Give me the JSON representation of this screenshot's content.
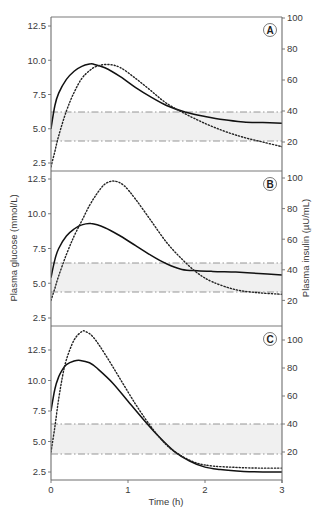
{
  "chart_data": {
    "type": "line",
    "layout": "three vertically stacked panels sharing x axis, dual y axes",
    "xlabel": "Time (h)",
    "ylabel_left": "Plasma glucose (mmol/L)",
    "ylabel_right": "Plasma insulin (µU/mL)",
    "x_ticks": [
      "0",
      "1",
      "2",
      "3"
    ],
    "xlim": [
      0,
      3
    ],
    "y_left_ticks": [
      "2.5",
      "5.0",
      "7.5",
      "10.0",
      "12.5"
    ],
    "y_right_ticks": [
      "20",
      "40",
      "60",
      "80",
      "100"
    ],
    "legend": [
      {
        "name": "Plasma glucose",
        "style": "solid line",
        "axis": "left"
      },
      {
        "name": "Plasma insulin",
        "style": "dotted line",
        "axis": "right"
      }
    ],
    "grid": false,
    "panels": [
      {
        "label": "A",
        "glucose_ylim": [
          2.0,
          13.2
        ],
        "insulin_ylim": [
          0,
          100
        ],
        "normal_band_glucose": [
          4.1,
          6.2
        ],
        "series": [
          {
            "name": "Plasma glucose",
            "axis": "left",
            "style": "solid",
            "x": [
              0,
              0.05,
              0.1,
              0.2,
              0.3,
              0.4,
              0.5,
              0.55,
              0.7,
              0.9,
              1.1,
              1.3,
              1.5,
              1.75,
              2.0,
              2.25,
              2.5,
              2.75,
              3.0
            ],
            "values": [
              5.0,
              6.7,
              7.6,
              8.6,
              9.2,
              9.55,
              9.72,
              9.72,
              9.45,
              8.8,
              8.0,
              7.3,
              6.7,
              6.2,
              5.9,
              5.65,
              5.5,
              5.45,
              5.4
            ]
          },
          {
            "name": "Plasma insulin",
            "axis": "right",
            "style": "dotted",
            "x": [
              0,
              0.05,
              0.1,
              0.2,
              0.3,
              0.4,
              0.5,
              0.6,
              0.75,
              0.9,
              1.1,
              1.3,
              1.5,
              1.75,
              2.0,
              2.25,
              2.5,
              2.75,
              3.0
            ],
            "values": [
              4,
              14,
              24,
              40,
              52,
              61,
              66,
              69,
              70,
              68,
              61,
              53,
              45,
              38,
              32,
              27,
              23,
              20,
              17
            ]
          }
        ]
      },
      {
        "label": "B",
        "glucose_ylim": [
          1.8,
          13.1
        ],
        "insulin_ylim": [
          0,
          100
        ],
        "normal_band_glucose": [
          4.3,
          6.3
        ],
        "series": [
          {
            "name": "Plasma glucose",
            "axis": "left",
            "style": "solid",
            "x": [
              0,
              0.05,
              0.1,
              0.2,
              0.3,
              0.4,
              0.52,
              0.7,
              0.9,
              1.1,
              1.3,
              1.5,
              1.7,
              1.9,
              2.1,
              2.4,
              2.7,
              3.0
            ],
            "values": [
              5.4,
              6.7,
              7.5,
              8.4,
              8.9,
              9.2,
              9.3,
              9.0,
              8.4,
              7.7,
              7.0,
              6.4,
              6.0,
              5.9,
              5.85,
              5.8,
              5.7,
              5.6
            ]
          },
          {
            "name": "Plasma insulin",
            "axis": "right",
            "style": "dotted",
            "x": [
              0,
              0.05,
              0.1,
              0.2,
              0.3,
              0.4,
              0.5,
              0.6,
              0.7,
              0.82,
              0.95,
              1.1,
              1.3,
              1.5,
              1.7,
              1.9,
              2.1,
              2.4,
              2.7,
              3.0
            ],
            "values": [
              20,
              28,
              36,
              50,
              62,
              72,
              82,
              90,
              96,
              98,
              95,
              86,
              72,
              58,
              47,
              38,
              32,
              27,
              25,
              24
            ]
          }
        ]
      },
      {
        "label": "C",
        "glucose_ylim": [
          1.9,
          14.3
        ],
        "insulin_ylim": [
          0,
          100
        ],
        "normal_band_glucose": [
          3.9,
          6.4
        ],
        "series": [
          {
            "name": "Plasma glucose",
            "axis": "left",
            "style": "solid",
            "x": [
              0,
              0.05,
              0.1,
              0.15,
              0.2,
              0.3,
              0.38,
              0.5,
              0.6,
              0.8,
              1.0,
              1.2,
              1.4,
              1.6,
              1.8,
              2.0,
              2.2,
              2.5,
              2.75,
              3.0
            ],
            "values": [
              7.5,
              9.3,
              10.3,
              10.9,
              11.3,
              11.6,
              11.65,
              11.45,
              11.0,
              9.8,
              8.3,
              6.8,
              5.4,
              4.2,
              3.4,
              2.9,
              2.7,
              2.55,
              2.5,
              2.5
            ]
          },
          {
            "name": "Plasma insulin",
            "axis": "right",
            "style": "dotted",
            "x": [
              0,
              0.05,
              0.1,
              0.15,
              0.2,
              0.3,
              0.4,
              0.45,
              0.55,
              0.7,
              0.9,
              1.1,
              1.3,
              1.5,
              1.7,
              1.9,
              2.1,
              2.4,
              2.7,
              3.0
            ],
            "values": [
              20,
              38,
              58,
              74,
              86,
              100,
              106,
              106,
              102,
              90,
              72,
              54,
              38,
              25,
              17,
              12,
              10,
              9,
              8.5,
              8.5
            ]
          }
        ]
      }
    ]
  },
  "geometry": {
    "x0_px": 51,
    "x3_px": 282,
    "panels": [
      {
        "top": 17,
        "bottom": 171,
        "g_hi": 12.5,
        "g_hi_px": 26,
        "g_lo": 2.5,
        "g_lo_px": 163,
        "i_hi_px": 18,
        "i_zero_px": 173,
        "band_top_px": 112,
        "band_bottom_px": 141
      },
      {
        "top": 171,
        "bottom": 326,
        "g_hi": 12.5,
        "g_hi_px": 179,
        "g_lo": 2.5,
        "g_lo_px": 318,
        "i_hi_px": 178,
        "i_zero_px": 331,
        "band_top_px": 263,
        "band_bottom_px": 292
      },
      {
        "top": 326,
        "bottom": 480,
        "g_hi": 12.5,
        "g_hi_px": 350,
        "g_lo": 2.5,
        "g_lo_px": 472,
        "i_hi_px": 340,
        "i_zero_px": 480,
        "band_top_px": 424,
        "band_bottom_px": 454
      }
    ]
  },
  "colors": {
    "axis": "#6e6e6e",
    "frame": "#7a7a7a",
    "band_fill": "#f0f0f0",
    "band_line": "#8a8a8a",
    "glucose_line": "#111111",
    "insulin_line": "#222222",
    "text": "#3a3a3a"
  }
}
